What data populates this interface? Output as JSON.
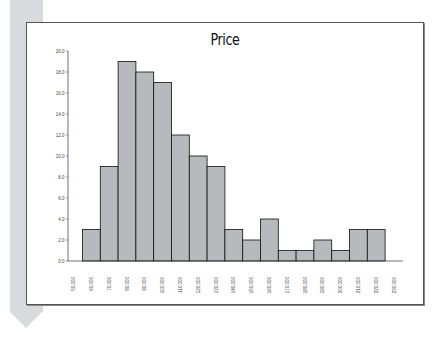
{
  "chart_data": {
    "type": "bar",
    "title": "Price",
    "xlabel": "",
    "ylabel": "",
    "ylim": [
      0,
      20
    ],
    "yticks": [
      "0.0",
      "2.0",
      "4.0",
      "6.0",
      "8.0",
      "10.0",
      "12.0",
      "14.0",
      "16.0",
      "18.0",
      "20.0"
    ],
    "xticks": [
      "50,000",
      "60,000",
      "70,000",
      "80,000",
      "90,000",
      "100,000",
      "110,000",
      "120,000",
      "130,000",
      "140,000",
      "150,000",
      "160,000",
      "170,000",
      "180,000",
      "190,000",
      "200,000",
      "210,000",
      "220,000",
      "230,000"
    ],
    "categories": [
      "60,000",
      "70,000",
      "80,000",
      "90,000",
      "100,000",
      "110,000",
      "120,000",
      "130,000",
      "140,000",
      "150,000",
      "160,000",
      "170,000",
      "180,000",
      "190,000",
      "200,000",
      "210,000",
      "220,000"
    ],
    "values": [
      3,
      9,
      19,
      18,
      17,
      12,
      10,
      9,
      3,
      2,
      4,
      1,
      1,
      2,
      1,
      3,
      3
    ],
    "grid": false,
    "legend": "none",
    "bar_color": "#b8b9bc",
    "bar_edge_color": "#111111"
  },
  "page": {
    "title": "Price",
    "stripe_color": "#d9dadd"
  }
}
